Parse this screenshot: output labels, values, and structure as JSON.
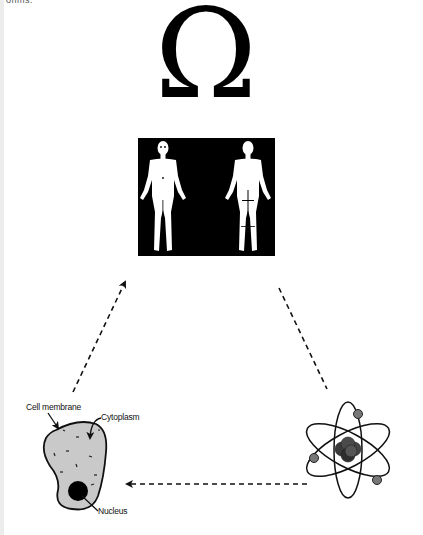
{
  "top_text": "ohms.",
  "symbol": {
    "glyph": "Ω",
    "meaning": "omega"
  },
  "human_figure_panel": {
    "background_color": "#000000",
    "figures": [
      "front-view",
      "back-view"
    ]
  },
  "cell": {
    "labels": {
      "membrane": "Cell membrane",
      "cytoplasm": "Cytoplasm",
      "nucleus": "Nucleus"
    },
    "fill_color": "#c9c9c9",
    "nucleus_color": "#000000"
  },
  "atom": {
    "electron_color": "#777777",
    "nucleus_color": "#3a3a3a"
  },
  "arrows": [
    {
      "from": "cell",
      "to": "human-body",
      "style": "dashed",
      "arrowhead": true
    },
    {
      "from": "human-body",
      "to": "atom",
      "style": "dashed",
      "arrowhead": false
    },
    {
      "from": "atom",
      "to": "cell",
      "style": "dashed",
      "arrowhead": true
    }
  ]
}
